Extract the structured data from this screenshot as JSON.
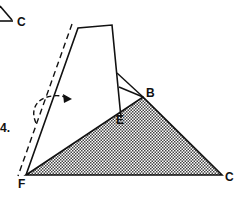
{
  "figure": {
    "step_number": "4.",
    "labels": {
      "top_c": "C",
      "b": "B",
      "e": "E",
      "f": "F",
      "c": "C"
    },
    "colors": {
      "stroke": "#111111",
      "shade_fg": "#555555",
      "shade_bg": "#ffffff"
    }
  }
}
